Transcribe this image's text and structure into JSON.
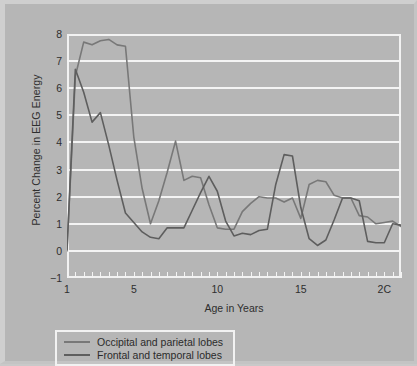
{
  "chart_data": {
    "type": "line",
    "title": "",
    "xlabel": "Age in Years",
    "ylabel": "Percent Change in EEG Energy",
    "xlim": [
      1,
      21
    ],
    "ylim": [
      -1,
      8
    ],
    "grid": true,
    "legend_position": "below-axes-left",
    "xticks": [
      1,
      5,
      10,
      15,
      20
    ],
    "xtick_labels": [
      "1",
      "5",
      "10",
      "15",
      "2C"
    ],
    "yticks": [
      -1,
      0,
      1,
      2,
      3,
      4,
      5,
      6,
      7,
      8
    ],
    "ytick_labels": [
      "−1",
      "0",
      "1",
      "2",
      "3",
      "4",
      "5",
      "6",
      "7",
      "8"
    ],
    "series": [
      {
        "name": "Occipital and parietal lobes",
        "color": "#787878",
        "x": [
          1,
          1.5,
          2,
          2.5,
          3,
          3.5,
          4,
          4.5,
          5,
          5.5,
          6,
          6.5,
          7,
          7.5,
          8,
          8.5,
          9,
          9.5,
          10,
          10.5,
          11,
          11.5,
          12,
          12.5,
          13,
          13.5,
          14,
          14.5,
          15,
          15.5,
          16,
          16.5,
          17,
          17.5,
          18,
          18.5,
          19,
          19.5,
          20,
          20.5,
          21
        ],
        "y": [
          0.0,
          6.45,
          7.7,
          7.6,
          7.75,
          7.8,
          7.6,
          7.55,
          4.2,
          2.3,
          1.0,
          1.85,
          2.9,
          4.05,
          2.6,
          2.75,
          2.7,
          1.7,
          0.85,
          0.8,
          0.8,
          1.45,
          1.75,
          2.0,
          1.95,
          1.95,
          1.8,
          1.95,
          1.2,
          2.45,
          2.6,
          2.55,
          2.05,
          1.95,
          1.95,
          1.3,
          1.25,
          1.0,
          1.05,
          1.1,
          0.9
        ]
      },
      {
        "name": "Frontal and temporal lobes",
        "color": "#5e5e5e",
        "x": [
          1,
          1.5,
          2,
          2.5,
          3,
          3.5,
          4,
          4.5,
          5,
          5.5,
          6,
          6.5,
          7,
          7.5,
          8,
          8.5,
          9,
          9.5,
          10,
          10.5,
          11,
          11.5,
          12,
          12.5,
          13,
          13.5,
          14,
          14.5,
          15,
          15.5,
          16,
          16.5,
          17,
          17.5,
          18,
          18.5,
          19,
          19.5,
          20,
          20.5,
          21
        ],
        "y": [
          0.05,
          6.7,
          5.85,
          4.75,
          5.1,
          3.9,
          2.6,
          1.4,
          1.05,
          0.7,
          0.5,
          0.45,
          0.85,
          0.85,
          0.85,
          1.5,
          2.15,
          2.75,
          2.2,
          1.1,
          0.55,
          0.65,
          0.6,
          0.75,
          0.8,
          2.45,
          3.55,
          3.5,
          1.6,
          0.45,
          0.2,
          0.4,
          1.15,
          1.95,
          1.95,
          1.85,
          0.35,
          0.3,
          0.3,
          1.0,
          0.95
        ]
      }
    ]
  },
  "legend": {
    "entries": [
      {
        "label": "Occipital and parietal lobes",
        "color": "#787878"
      },
      {
        "label": "Frontal and temporal lobes",
        "color": "#5e5e5e"
      }
    ]
  }
}
